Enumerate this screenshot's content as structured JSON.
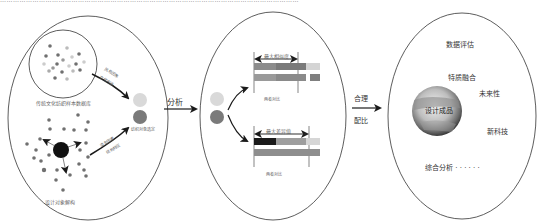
{
  "top_strip_text": "…………………………………………………………………………………………………………………………",
  "panel1": {
    "sample_db_label": "传统文化纺织样本数据库",
    "design_object_label": "设计对象解构",
    "arrow1_labels": [
      "风格因素",
      "文化内涵"
    ],
    "arrow2_labels": [
      "造型因素",
      "结构特征"
    ],
    "target_label": "纺织对象选定"
  },
  "connector1": {
    "label": "分析"
  },
  "panel2": {
    "top_bracket_label": "最大相似度",
    "top_caption": "两者对比",
    "bottom_bracket_label": "最大差异值",
    "bottom_caption": "两者对比",
    "top_bars": [
      [
        {
          "w": 22,
          "c": "#8c8c8c"
        },
        {
          "w": 30,
          "c": "#7a7a7a"
        },
        {
          "w": 14,
          "c": "#d4d4d4"
        }
      ],
      [
        {
          "w": 22,
          "c": "#9a9a9a"
        },
        {
          "w": 30,
          "c": "#8a8a8a"
        },
        {
          "w": 4,
          "c": "#ffffff"
        },
        {
          "w": 10,
          "c": "#7f7f7f"
        }
      ]
    ],
    "bottom_bars": [
      [
        {
          "w": 22,
          "c": "#1a1a1a"
        },
        {
          "w": 30,
          "c": "#9e9e9e"
        },
        {
          "w": 14,
          "c": "#d6d6d6"
        }
      ],
      [
        {
          "w": 66,
          "c": "#8e8e8e"
        }
      ]
    ]
  },
  "connector2": {
    "label_top": "合理",
    "label_bottom": "配比"
  },
  "panel3": {
    "center_label": "设计成品",
    "items": [
      "数据评估",
      "特质融合",
      "未来性",
      "新科技",
      "综合分析 · · · · · ·"
    ]
  },
  "colors": {
    "outline": "#333333",
    "arrow": "#1a1a1a",
    "light_circle": "#d9d9d9",
    "dark_circle": "#7a7a7a",
    "core_circle": "#111111",
    "dot": "#6f6f6f"
  }
}
